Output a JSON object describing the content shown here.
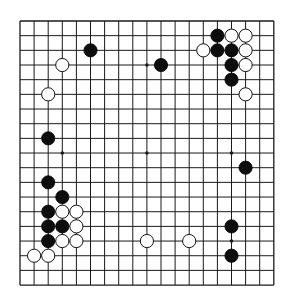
{
  "board": {
    "size": 19,
    "origin_x": 20,
    "origin_y": 21,
    "step_x": 14.1,
    "step_y": 14.67,
    "line_color": "#1a1a1a",
    "background": "#ffffff",
    "stone_radius": 6.6,
    "hoshi": [
      [
        3,
        3
      ],
      [
        9,
        3
      ],
      [
        15,
        3
      ],
      [
        3,
        9
      ],
      [
        9,
        9
      ],
      [
        15,
        9
      ],
      [
        3,
        15
      ],
      [
        9,
        15
      ],
      [
        15,
        15
      ]
    ],
    "stones": {
      "black": [
        [
          5,
          2
        ],
        [
          10,
          3
        ],
        [
          14,
          1
        ],
        [
          14,
          2
        ],
        [
          15,
          2
        ],
        [
          15,
          3
        ],
        [
          15,
          4
        ],
        [
          2,
          8
        ],
        [
          16,
          10
        ],
        [
          2,
          11
        ],
        [
          3,
          12
        ],
        [
          2,
          13
        ],
        [
          2,
          14
        ],
        [
          3,
          14
        ],
        [
          2,
          15
        ],
        [
          15,
          14
        ],
        [
          15,
          16
        ]
      ],
      "white": [
        [
          3,
          3
        ],
        [
          2,
          5
        ],
        [
          15,
          1
        ],
        [
          16,
          1
        ],
        [
          13,
          2
        ],
        [
          16,
          2
        ],
        [
          16,
          3
        ],
        [
          16,
          5
        ],
        [
          3,
          13
        ],
        [
          4,
          13
        ],
        [
          4,
          14
        ],
        [
          3,
          15
        ],
        [
          4,
          15
        ],
        [
          1,
          16
        ],
        [
          2,
          16
        ],
        [
          9,
          15
        ],
        [
          12,
          15
        ]
      ]
    }
  }
}
